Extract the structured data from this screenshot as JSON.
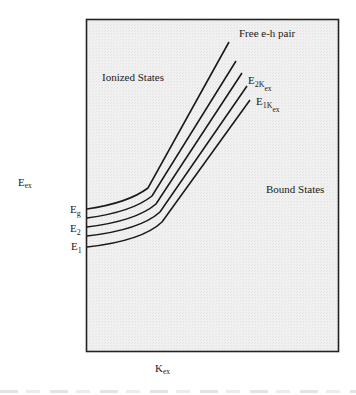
{
  "diagram": {
    "y_axis_label": {
      "main": "E",
      "sub": "ex"
    },
    "x_axis_label": {
      "main": "K",
      "sub": "ex"
    },
    "regions": {
      "ionized": "Ionized States",
      "bound": "Bound States"
    },
    "curve_labels": {
      "free_pair": "Free e-h pair",
      "e2k": {
        "main": "E",
        "sub": "2K",
        "subsub": "ex"
      },
      "e1k": {
        "main": "E",
        "sub": "1K",
        "subsub": "ex"
      }
    },
    "level_labels": [
      {
        "main": "E",
        "sub": "g"
      },
      {
        "main": "E",
        "sub": "2"
      },
      {
        "main": "E",
        "sub": "1"
      }
    ],
    "curves": [
      {
        "name": "free-e-h-pair",
        "order": 0
      },
      {
        "name": "higher-exciton-curve",
        "order": 1
      },
      {
        "name": "curve-3",
        "order": 2
      },
      {
        "name": "E2K-ex",
        "order": 3
      },
      {
        "name": "E1K-ex",
        "order": 4
      }
    ],
    "colors": {
      "line": "#1a1a1a",
      "panel": "#efefef",
      "frame": "#222222"
    }
  }
}
